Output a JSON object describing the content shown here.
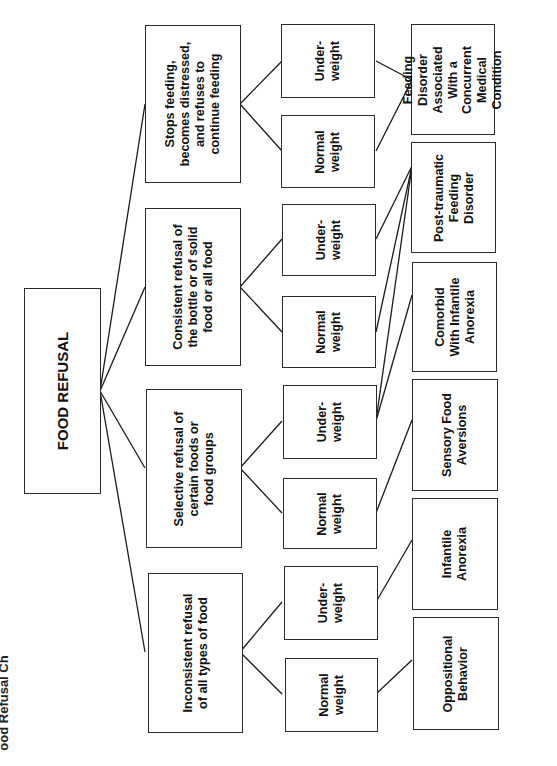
{
  "diagram": {
    "orientation": "rotated-90-ccw",
    "root": {
      "label": "FOOD REFUSAL"
    },
    "categories": [
      {
        "label": "Stops feeding,\nbecomes distressed,\nand refuses to\ncontinue feeding"
      },
      {
        "label": "Consistent refusal of\nthe bottle or of solid\nfood or all food"
      },
      {
        "label": "Selective refusal of\ncertain foods or\nfood groups"
      },
      {
        "label": "Inconsistent refusal\nof all types of food"
      }
    ],
    "weights": [
      {
        "label": "Under-\nweight",
        "parent": 0
      },
      {
        "label": "Normal\nweight",
        "parent": 0
      },
      {
        "label": "Under-\nweight",
        "parent": 1
      },
      {
        "label": "Normal\nweight",
        "parent": 1
      },
      {
        "label": "Under-\nweight",
        "parent": 2
      },
      {
        "label": "Normal\nweight",
        "parent": 2
      },
      {
        "label": "Under-\nweight",
        "parent": 3
      },
      {
        "label": "Normal\nweight",
        "parent": 3
      }
    ],
    "outcomes": [
      {
        "label": "Feeding\nDisorder\nAssociated\nWith a\nConcurrent\nMedical\nCondition",
        "from_weights": [
          0,
          1
        ]
      },
      {
        "label": "Post-traumatic\nFeeding\nDisorder",
        "from_weights": [
          2,
          3,
          4
        ]
      },
      {
        "label": "Comorbid\nWith Infantile\nAnorexia",
        "from_weights": [
          4
        ]
      },
      {
        "label": "Sensory Food\nAversions",
        "from_weights": [
          5
        ]
      },
      {
        "label": "Infantile\nAnorexia",
        "from_weights": [
          6
        ]
      },
      {
        "label": "Oppositional\nBehavior",
        "from_weights": [
          7
        ]
      }
    ],
    "edge_partial_text": "ood Refusal Ch",
    "colors": {
      "line": "#1a1a1a",
      "box_border": "#2a2a2a",
      "text": "#111111",
      "background": "#ffffff"
    }
  }
}
